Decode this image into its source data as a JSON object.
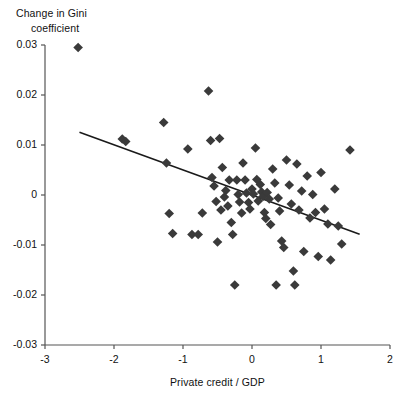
{
  "chart_data": {
    "type": "scatter",
    "title": "",
    "xlabel": "Private credit / GDP",
    "ylabel": "Change in Gini coefficient",
    "ylabel_line1": "Change in Gini",
    "ylabel_line2": "coefficient",
    "xlim": [
      -3,
      2
    ],
    "ylim": [
      -0.03,
      0.03
    ],
    "xticks": [
      -3,
      -2,
      -1,
      0,
      1,
      2
    ],
    "xticklabels": [
      "-3",
      "-2",
      "-1",
      "0",
      "1",
      "2"
    ],
    "yticks": [
      0.03,
      0.02,
      0.01,
      0,
      -0.01,
      -0.02,
      -0.03
    ],
    "yticklabels": [
      "0.03",
      "0.02",
      "0.01",
      "0",
      "-0.01",
      "-0.02",
      "-0.03"
    ],
    "grid": false,
    "legend": null,
    "marker": "diamond",
    "marker_color": "#3a3a3a",
    "marker_size": 7,
    "axis_color": "#555555",
    "trendline": {
      "type": "linear-fit",
      "color": "#1a1a1a",
      "x_start": -2.5,
      "y_start": 0.01255,
      "x_end": 1.56,
      "y_end": -0.00785,
      "slope": -0.00502,
      "intercept": 0.0
    },
    "points": [
      [
        -2.52,
        0.0295
      ],
      [
        -1.88,
        0.0112
      ],
      [
        -1.83,
        0.0107
      ],
      [
        -1.28,
        0.0145
      ],
      [
        -1.24,
        0.0064
      ],
      [
        -1.2,
        -0.0037
      ],
      [
        -1.15,
        -0.0077
      ],
      [
        -0.93,
        0.0092
      ],
      [
        -0.87,
        -0.0079
      ],
      [
        -0.78,
        -0.0079
      ],
      [
        -0.72,
        -0.0036
      ],
      [
        -0.63,
        0.0208
      ],
      [
        -0.6,
        0.0109
      ],
      [
        -0.58,
        0.0035
      ],
      [
        -0.55,
        0.0018
      ],
      [
        -0.52,
        -0.0013
      ],
      [
        -0.5,
        -0.0094
      ],
      [
        -0.47,
        0.0113
      ],
      [
        -0.45,
        -0.003
      ],
      [
        -0.43,
        0.0055
      ],
      [
        -0.4,
        -0.0004
      ],
      [
        -0.38,
        0.0009
      ],
      [
        -0.35,
        -0.0022
      ],
      [
        -0.33,
        0.003
      ],
      [
        -0.3,
        -0.0055
      ],
      [
        -0.28,
        -0.0079
      ],
      [
        -0.25,
        -0.018
      ],
      [
        -0.22,
        0.003
      ],
      [
        -0.2,
        0.0001
      ],
      [
        -0.18,
        -0.0014
      ],
      [
        -0.15,
        -0.0036
      ],
      [
        -0.13,
        0.0064
      ],
      [
        -0.1,
        0.003
      ],
      [
        -0.08,
        0.0004
      ],
      [
        -0.05,
        -0.0015
      ],
      [
        -0.03,
        -0.0028
      ],
      [
        0.0,
        0.0012
      ],
      [
        0.02,
        0.0002
      ],
      [
        0.05,
        0.0094
      ],
      [
        0.07,
        0.0031
      ],
      [
        0.09,
        -0.0012
      ],
      [
        0.12,
        0.0021
      ],
      [
        0.14,
        0.0006
      ],
      [
        0.16,
        -0.0003
      ],
      [
        0.18,
        -0.0035
      ],
      [
        0.2,
        -0.0047
      ],
      [
        0.22,
        0.0005
      ],
      [
        0.25,
        -0.0008
      ],
      [
        0.27,
        -0.0059
      ],
      [
        0.3,
        0.0052
      ],
      [
        0.33,
        0.0024
      ],
      [
        0.35,
        -0.018
      ],
      [
        0.38,
        -0.0006
      ],
      [
        0.4,
        -0.0032
      ],
      [
        0.43,
        -0.0092
      ],
      [
        0.46,
        -0.0105
      ],
      [
        0.5,
        0.007
      ],
      [
        0.54,
        0.002
      ],
      [
        0.57,
        -0.0018
      ],
      [
        0.6,
        -0.0152
      ],
      [
        0.62,
        -0.018
      ],
      [
        0.65,
        0.0062
      ],
      [
        0.68,
        -0.003
      ],
      [
        0.72,
        0.0008
      ],
      [
        0.75,
        -0.0113
      ],
      [
        0.8,
        0.0038
      ],
      [
        0.84,
        -0.0046
      ],
      [
        0.88,
        0.0001
      ],
      [
        0.92,
        -0.0035
      ],
      [
        0.96,
        -0.0123
      ],
      [
        1.0,
        0.0045
      ],
      [
        1.05,
        -0.0028
      ],
      [
        1.1,
        -0.0058
      ],
      [
        1.14,
        -0.013
      ],
      [
        1.2,
        0.0012
      ],
      [
        1.25,
        -0.0062
      ],
      [
        1.3,
        -0.0098
      ],
      [
        1.42,
        0.009
      ]
    ]
  }
}
